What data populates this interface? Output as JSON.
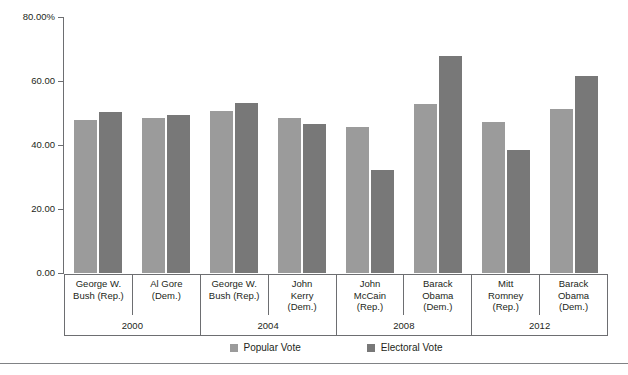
{
  "chart_data": {
    "type": "bar",
    "title": "",
    "subtitle": "",
    "xlabel": "",
    "ylabel": "",
    "ylim": [
      0,
      80
    ],
    "grid": false,
    "legend_position": "bottom",
    "y_ticks": [
      "0.00",
      "20.00",
      "40.00",
      "60.00",
      "80.00%"
    ],
    "y_tick_values": [
      0,
      20,
      40,
      60,
      80
    ],
    "categories": [
      "George W. Bush (Rep.)",
      "Al Gore (Dem.)",
      "George W. Bush (Rep.)",
      "John Kerry (Dem.)",
      "John McCain (Rep.)",
      "Barack Obama (Dem.)",
      "Mitt Romney (Rep.)",
      "Barack Obama (Dem.)"
    ],
    "category_lines": [
      [
        "George W.",
        "Bush (Rep.)"
      ],
      [
        "Al Gore",
        "(Dem.)"
      ],
      [
        "George W.",
        "Bush (Rep.)"
      ],
      [
        "John",
        "Kerry",
        "(Dem.)"
      ],
      [
        "John",
        "McCain",
        "(Rep.)"
      ],
      [
        "Barack",
        "Obama",
        "(Dem.)"
      ],
      [
        "Mitt",
        "Romney",
        "(Rep.)"
      ],
      [
        "Barack",
        "Obama",
        "(Dem.)"
      ]
    ],
    "groups": [
      {
        "year": "2000",
        "span": 2
      },
      {
        "year": "2004",
        "span": 2
      },
      {
        "year": "2008",
        "span": 2
      },
      {
        "year": "2012",
        "span": 2
      }
    ],
    "series": [
      {
        "name": "Popular Vote",
        "color": "#9b9b9b",
        "values": [
          47.9,
          48.4,
          50.7,
          48.3,
          45.7,
          52.9,
          47.2,
          51.1
        ]
      },
      {
        "name": "Electoral Vote",
        "color": "#787878",
        "values": [
          50.4,
          49.4,
          53.2,
          46.7,
          32.2,
          67.8,
          38.3,
          61.7
        ]
      }
    ]
  },
  "legend": {
    "items": [
      {
        "label": "Popular Vote",
        "color": "#9b9b9b"
      },
      {
        "label": "Electoral Vote",
        "color": "#787878"
      }
    ]
  },
  "colors": {
    "popular_vote": "#9b9b9b",
    "electoral_vote": "#787878",
    "axis": "#6d6e71",
    "text": "#231f20",
    "rule": "#808285",
    "background": "#ffffff"
  }
}
